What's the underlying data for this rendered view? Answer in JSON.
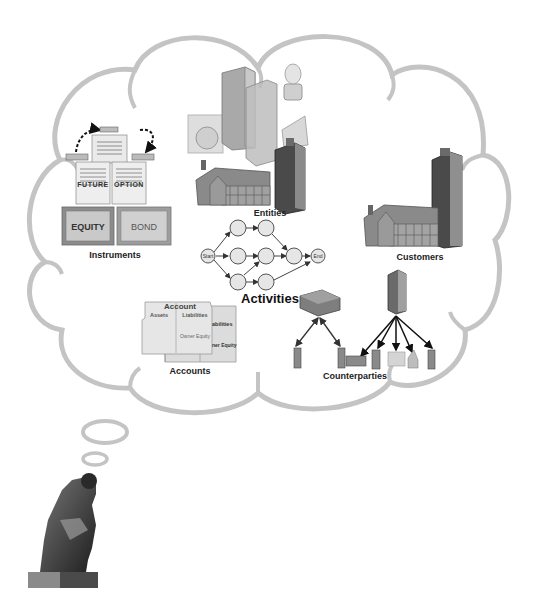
{
  "diagram": {
    "type": "thought-bubble concept diagram",
    "colors": {
      "cloud_outline": "#c4c4c4",
      "background": "#ffffff",
      "node_fill": "#e6e6e6",
      "node_stroke": "#555555",
      "building_dark": "#4a4a4a",
      "building_mid": "#8a8a8a",
      "building_light": "#bdbdbd",
      "label_text": "#222222"
    },
    "groups": [
      {
        "id": "instruments",
        "label": "Instruments",
        "items": [
          "FUTURE",
          "OPTION",
          "EQUITY",
          "BOND"
        ]
      },
      {
        "id": "entities",
        "label": "Entities"
      },
      {
        "id": "activities",
        "label": "Activities",
        "nodes": [
          "Start",
          "End"
        ]
      },
      {
        "id": "customers",
        "label": "Customers"
      },
      {
        "id": "accounts",
        "label": "Accounts",
        "folder_labels": {
          "front_title": "Account",
          "front_assets": "Assets",
          "front_liabilities": "Liabilities",
          "front_owner_equity": "Owner Equity",
          "back_liabilities": "abilities",
          "back_owner_equity": "ner Equity"
        }
      },
      {
        "id": "counterparties",
        "label": "Counterparties"
      }
    ],
    "figure": "thinker-statue"
  }
}
